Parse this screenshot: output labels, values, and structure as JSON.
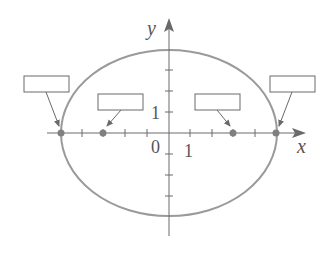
{
  "diagram": {
    "type": "ellipse-foci-diagram",
    "axes": {
      "x_label": "x",
      "y_label": "y",
      "origin_label": "0",
      "x_unit_label": "1",
      "y_unit_label": "1"
    },
    "ellipse": {
      "a": 5,
      "b": 4
    },
    "points": [
      {
        "name": "left-vertex",
        "x": -5,
        "y": 0,
        "label": ""
      },
      {
        "name": "left-focus",
        "x": -3,
        "y": 0,
        "label": ""
      },
      {
        "name": "right-focus",
        "x": 3,
        "y": 0,
        "label": ""
      },
      {
        "name": "right-vertex",
        "x": 5,
        "y": 0,
        "label": ""
      }
    ],
    "colors": {
      "curve": "#9a9a9a",
      "axis": "#6a6a6a",
      "point": "#808080"
    }
  }
}
